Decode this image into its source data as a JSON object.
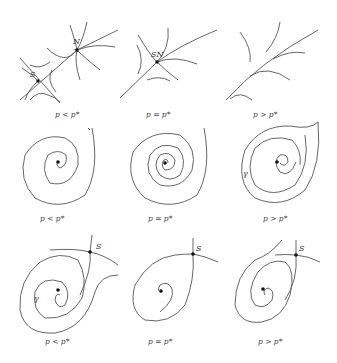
{
  "figure": {
    "rows": [
      {
        "name": "saddle-node-bifurcation",
        "panels": [
          {
            "caption": "p < p*",
            "points": [
              "S",
              "N"
            ]
          },
          {
            "caption": "p = p*",
            "points": [
              "SN"
            ]
          },
          {
            "caption": "p > p*",
            "points": []
          }
        ]
      },
      {
        "name": "hopf-bifurcation",
        "panels": [
          {
            "caption": "p < p*",
            "orbit_label": ""
          },
          {
            "caption": "p = p*",
            "orbit_label": ""
          },
          {
            "caption": "p > p*",
            "orbit_label": "γ"
          }
        ]
      },
      {
        "name": "homoclinic-bifurcation",
        "panels": [
          {
            "caption": "p < p*",
            "points": [
              "S"
            ],
            "orbit_label": "γ"
          },
          {
            "caption": "p = p*",
            "points": [
              "S"
            ]
          },
          {
            "caption": "p > p*",
            "points": [
              "S"
            ]
          }
        ]
      }
    ],
    "labels": {
      "S": "S",
      "N": "N",
      "SN": "SN",
      "gamma": "γ"
    },
    "captions": {
      "r1c1": "p < p*",
      "r1c2": "p = p*",
      "r1c3": "p > p*",
      "r2c1": "p < p*",
      "r2c2": "p = p*",
      "r2c3": "p > p*",
      "r3c1": "p < p*",
      "r3c2": "p = p*",
      "r3c3": "p > p*"
    }
  }
}
